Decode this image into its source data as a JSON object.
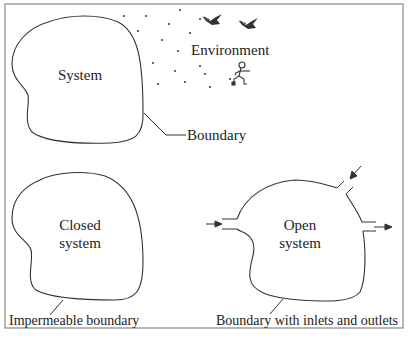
{
  "colors": {
    "background": "#ffffff",
    "frame": "#888888",
    "stroke": "#333333",
    "text": "#222222"
  },
  "panels": {
    "system": {
      "label": "System",
      "boundary_label": "Boundary",
      "environment_label": "Environment",
      "environment_icons": [
        "bird-icon",
        "bird-icon",
        "running-person-icon"
      ]
    },
    "closed": {
      "label_line1": "Closed",
      "label_line2": "system",
      "caption": "Impermeable boundary"
    },
    "open": {
      "label_line1": "Open",
      "label_line2": "system",
      "caption": "Boundary with inlets and outlets",
      "ports": [
        "inlet-left",
        "inlet-top-right",
        "outlet-right"
      ]
    }
  }
}
